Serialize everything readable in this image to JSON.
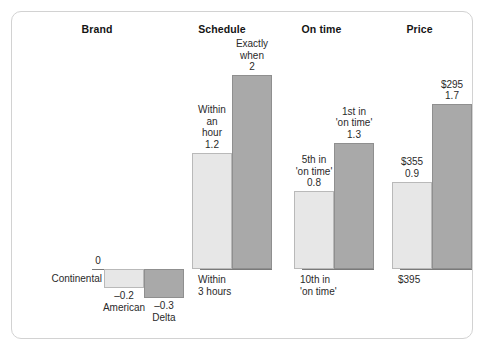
{
  "chart_data": {
    "type": "bar",
    "title": "",
    "subtitle": "",
    "xlabel": "",
    "ylabel": "",
    "grid": false,
    "legend_position": "none",
    "baseline_value": 0,
    "baseline_label": "0",
    "categories": [
      "Brand",
      "Schedule",
      "On time",
      "Price"
    ],
    "series": [
      {
        "name": "Continental",
        "color": "#ffffff",
        "values": [
          0,
          0,
          0,
          0
        ]
      },
      {
        "name": "American",
        "color": "#e7e7e7",
        "values": [
          -0.2,
          1.2,
          0.8,
          0.9
        ]
      },
      {
        "name": "Delta",
        "color": "#a9a9a9",
        "values": [
          -0.3,
          2,
          1.3,
          1.7
        ]
      }
    ],
    "groups": [
      {
        "title": "Brand",
        "baseline_label": "0",
        "baseline_caption": "Continental",
        "bars": [
          {
            "airline": "American",
            "style": "light",
            "value": -0.2,
            "value_label": "–0.2",
            "caption": "American"
          },
          {
            "airline": "Delta",
            "style": "dark",
            "value": -0.3,
            "value_label": "–0.3",
            "caption": "Delta"
          }
        ]
      },
      {
        "title": "Schedule",
        "baseline_label": "0",
        "baseline_caption": "Within\n3 hours",
        "bars": [
          {
            "airline": "American",
            "style": "light",
            "value": 1.2,
            "value_label": "1.2",
            "caption": "Within\nan\nhour"
          },
          {
            "airline": "Delta",
            "style": "dark",
            "value": 2,
            "value_label": "2",
            "caption": "Exactly\nwhen"
          }
        ]
      },
      {
        "title": "On time",
        "baseline_label": "0",
        "baseline_caption": "10th in\n'on time'",
        "bars": [
          {
            "airline": "American",
            "style": "light",
            "value": 0.8,
            "value_label": "0.8",
            "caption": "5th in\n'on time'"
          },
          {
            "airline": "Delta",
            "style": "dark",
            "value": 1.3,
            "value_label": "1.3",
            "caption": "1st in\n'on time'"
          }
        ]
      },
      {
        "title": "Price",
        "baseline_label": "0",
        "baseline_caption": "$395",
        "bars": [
          {
            "airline": "American",
            "style": "light",
            "value": 0.9,
            "value_label": "0.9",
            "caption": "$355"
          },
          {
            "airline": "Delta",
            "style": "dark",
            "value": 1.7,
            "value_label": "1.7",
            "caption": "$295"
          }
        ]
      }
    ]
  },
  "colors": {
    "light_bar": "#e7e7e7",
    "dark_bar": "#a9a9a9",
    "baseline": "#7a7a7a",
    "card_border": "#d2d2d2",
    "text": "#2a2a2a",
    "title_text": "#151515"
  }
}
